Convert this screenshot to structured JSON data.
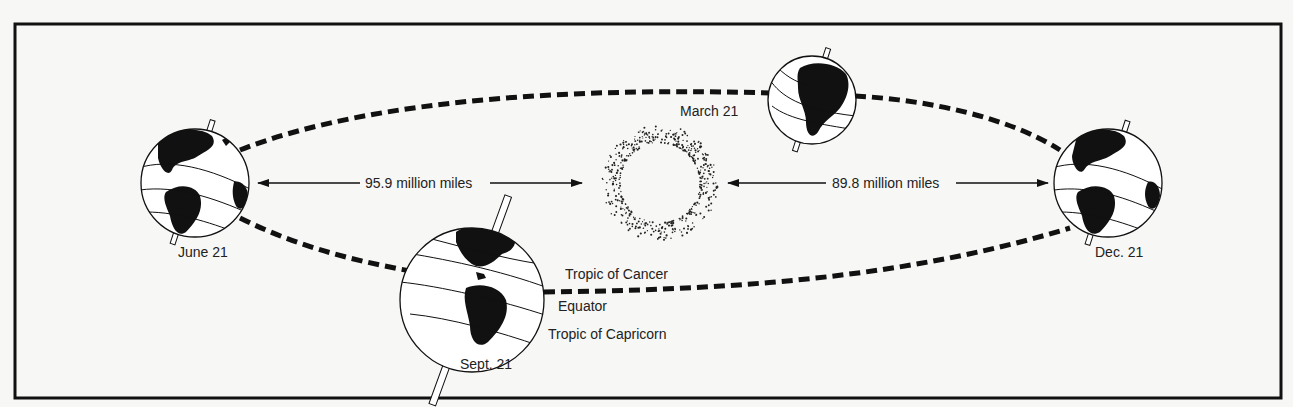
{
  "diagram": {
    "sun": {
      "name": "Sun"
    },
    "positions": [
      {
        "id": "june",
        "label": "June 21"
      },
      {
        "id": "sept",
        "label": "Sept. 21"
      },
      {
        "id": "march",
        "label": "March 21"
      },
      {
        "id": "dec",
        "label": "Dec. 21"
      }
    ],
    "distances": [
      {
        "id": "aphelion",
        "label": "95.9 million miles"
      },
      {
        "id": "perihelion",
        "label": "89.8 million miles"
      }
    ],
    "latitude_lines": {
      "tropic_cancer": "Tropic of Cancer",
      "equator": "Equator",
      "tropic_capricorn": "Tropic of Capricorn"
    },
    "colors": {
      "ink": "#111111",
      "paper": "#f7f7f5"
    }
  }
}
